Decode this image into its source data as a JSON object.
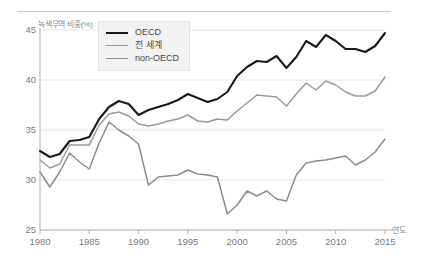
{
  "chart_data": {
    "type": "line",
    "title": "",
    "xlabel": "연도",
    "ylabel": "녹색무역 비중(%)",
    "xlim": [
      1980,
      2015
    ],
    "ylim": [
      25,
      45
    ],
    "grid": true,
    "legend_position": "top-left",
    "x": [
      1980,
      1981,
      1982,
      1983,
      1984,
      1985,
      1986,
      1987,
      1988,
      1989,
      1990,
      1991,
      1992,
      1993,
      1994,
      1995,
      1996,
      1997,
      1998,
      1999,
      2000,
      2001,
      2002,
      2003,
      2004,
      2005,
      2006,
      2007,
      2008,
      2009,
      2010,
      2011,
      2012,
      2013,
      2014,
      2015
    ],
    "xticks": [
      1980,
      1985,
      1990,
      1995,
      2000,
      2005,
      2010,
      2015
    ],
    "yticks": [
      25,
      30,
      35,
      40,
      45
    ],
    "series": [
      {
        "name": "OECD",
        "color": "#1a1a1a",
        "width": 2.1,
        "values": [
          32.9,
          32.3,
          32.6,
          33.9,
          34.0,
          34.3,
          36.1,
          37.3,
          37.9,
          37.6,
          36.5,
          37.0,
          37.3,
          37.6,
          38.0,
          38.6,
          38.2,
          37.8,
          38.1,
          38.8,
          40.4,
          41.3,
          41.9,
          41.8,
          42.4,
          41.2,
          42.3,
          43.9,
          43.3,
          44.5,
          43.9,
          43.1,
          43.1,
          42.8,
          43.4,
          44.7
        ]
      },
      {
        "name": "전 세계",
        "color": "#9a9a9a",
        "width": 1.5,
        "values": [
          32.0,
          31.2,
          31.6,
          33.5,
          33.5,
          33.5,
          35.5,
          36.6,
          36.8,
          36.4,
          35.6,
          35.4,
          35.6,
          35.9,
          36.1,
          36.5,
          35.9,
          35.8,
          36.1,
          36.0,
          36.9,
          37.7,
          38.5,
          38.4,
          38.3,
          37.4,
          38.6,
          39.7,
          39.0,
          39.9,
          39.5,
          38.8,
          38.4,
          38.4,
          38.9,
          40.3
        ]
      },
      {
        "name": "non-OECD",
        "color": "#8c8c8c",
        "width": 1.5,
        "values": [
          30.8,
          29.3,
          30.8,
          32.7,
          31.8,
          31.1,
          33.7,
          35.8,
          35.0,
          34.4,
          33.6,
          29.5,
          30.3,
          30.4,
          30.5,
          31.0,
          30.6,
          30.5,
          30.3,
          26.6,
          27.5,
          28.9,
          28.4,
          28.9,
          28.1,
          27.9,
          30.5,
          31.7,
          31.9,
          32.0,
          32.2,
          32.4,
          31.5,
          32.0,
          32.8,
          34.1
        ]
      }
    ]
  },
  "legend": {
    "items": [
      {
        "label": "OECD"
      },
      {
        "label": "전 세계"
      },
      {
        "label": "non-OECD"
      }
    ]
  },
  "axes": {
    "y_title": "녹색무역 비중(%)",
    "x_title": "연도",
    "y_ticks": [
      "45",
      "40",
      "35",
      "30",
      "25"
    ],
    "x_ticks": [
      "1980",
      "1985",
      "1990",
      "1995",
      "2000",
      "2005",
      "2010",
      "2015"
    ]
  },
  "colors": {
    "oecd": "#1a1a1a",
    "world": "#9a9a9a",
    "non_oecd": "#8c8c8c",
    "grid": "#e6e6e6",
    "axis": "#b0b0b0",
    "legend_bg": "#f2f2f2"
  }
}
